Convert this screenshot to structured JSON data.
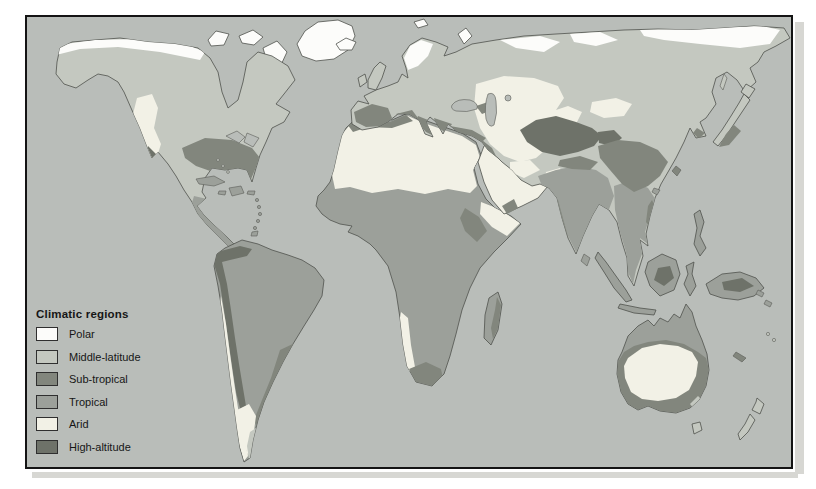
{
  "map": {
    "legend_title": "Climatic regions",
    "legend": [
      {
        "region": "polar",
        "label": "Polar"
      },
      {
        "region": "middle_latitude",
        "label": "Middle-latitude"
      },
      {
        "region": "sub_tropical",
        "label": "Sub-tropical"
      },
      {
        "region": "tropical",
        "label": "Tropical"
      },
      {
        "region": "arid",
        "label": "Arid"
      },
      {
        "region": "high_altitude",
        "label": "High-altitude"
      }
    ],
    "region_colors": {
      "polar": "#fcfcfa",
      "middle_latitude": "#c4c8c0",
      "sub_tropical": "#82867d",
      "tropical": "#9ca09a",
      "arid": "#f2f1e6",
      "high_altitude": "#6e7269",
      "ocean": "#b9bdb9"
    },
    "frame_color": "#141414",
    "coastline_color": "#4f524c"
  }
}
